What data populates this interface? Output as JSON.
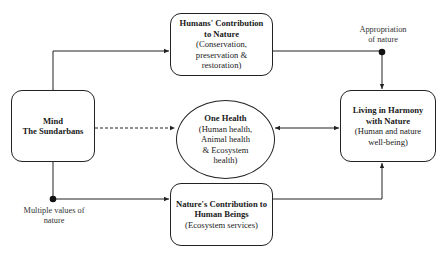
{
  "diagram": {
    "nodes": {
      "mind": {
        "title_line1": "Mind",
        "title_line2": "The Sundarbans"
      },
      "humans": {
        "title_line1": "Humans' Contribution",
        "title_line2": "to Nature",
        "sub_line1": "(Conservation,",
        "sub_line2": "preservation &",
        "sub_line3": "restoration)"
      },
      "one_health": {
        "title": "One Health",
        "sub_line1": "(Human health,",
        "sub_line2": "Animal health",
        "sub_line3": "& Ecosystem",
        "sub_line4": "health)"
      },
      "natures": {
        "title_line1": "Nature's Contribution to",
        "title_line2": "Human Beings",
        "sub_line1": "(Ecosystem services)"
      },
      "harmony": {
        "title_line1": "Living in Harmony",
        "title_line2": "with Nature",
        "sub_line1": "(Human and nature",
        "sub_line2": "well-being)"
      }
    },
    "labels": {
      "appropriation_line1": "Appropriation",
      "appropriation_line2": "of nature",
      "multiple_values_line1": "Multiple values of",
      "multiple_values_line2": "nature"
    },
    "edges": [
      {
        "from": "mind",
        "to": "humans",
        "style": "solid",
        "arrow": "end"
      },
      {
        "from": "mind",
        "to": "natures",
        "style": "solid",
        "arrow": "end",
        "marker": "dot",
        "label": "Multiple values of nature"
      },
      {
        "from": "mind",
        "to": "one_health",
        "style": "dashed",
        "arrow": "end"
      },
      {
        "from": "humans",
        "to": "harmony",
        "style": "solid",
        "arrow": "end",
        "marker": "dot",
        "label": "Appropriation of nature"
      },
      {
        "from": "natures",
        "to": "harmony",
        "style": "solid",
        "arrow": "end"
      },
      {
        "from": "one_health",
        "to": "harmony",
        "style": "solid",
        "arrow": "both"
      }
    ],
    "colors": {
      "line": "#222222",
      "background": "#ffffff"
    }
  }
}
